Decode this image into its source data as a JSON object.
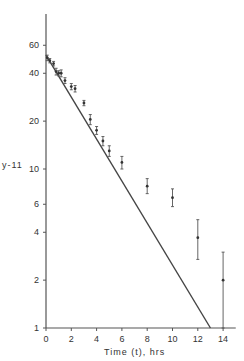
{
  "chart_data": {
    "type": "scatter",
    "title": "",
    "xlabel": "Time (t), hrs",
    "ylabel": "y-11",
    "yscale": "log",
    "xlim": [
      0,
      15
    ],
    "ylim": [
      1,
      90
    ],
    "grid": false,
    "x_ticks": [
      0,
      2,
      4,
      6,
      8,
      10,
      12,
      14
    ],
    "x_tick_labels": [
      "0",
      "2",
      "4",
      "6",
      "8",
      "10",
      "12",
      "14"
    ],
    "y_ticks": [
      1,
      2,
      4,
      6,
      10,
      20,
      40,
      60
    ],
    "y_tick_labels": [
      "1",
      "2",
      "4",
      "6",
      "10",
      "20",
      "40",
      "60"
    ],
    "series": [
      {
        "name": "observed",
        "style": "points with error bars",
        "points": [
          {
            "x": 0.1,
            "y": 50,
            "lo": 48,
            "hi": 52
          },
          {
            "x": 0.3,
            "y": 48,
            "lo": 46.5,
            "hi": 49.5
          },
          {
            "x": 0.6,
            "y": 46,
            "lo": 44.5,
            "hi": 47.5
          },
          {
            "x": 0.8,
            "y": 41,
            "lo": 39,
            "hi": 43
          },
          {
            "x": 1.0,
            "y": 40,
            "lo": 38.5,
            "hi": 41.5
          },
          {
            "x": 1.2,
            "y": 40,
            "lo": 38,
            "hi": 42
          },
          {
            "x": 1.5,
            "y": 36,
            "lo": 34.5,
            "hi": 37.5
          },
          {
            "x": 2.0,
            "y": 33,
            "lo": 31.5,
            "hi": 34.5
          },
          {
            "x": 2.3,
            "y": 32,
            "lo": 30.5,
            "hi": 33.5
          },
          {
            "x": 3.0,
            "y": 26,
            "lo": 25,
            "hi": 27
          },
          {
            "x": 3.5,
            "y": 20.5,
            "lo": 19,
            "hi": 22
          },
          {
            "x": 4.0,
            "y": 17.5,
            "lo": 16.5,
            "hi": 18.5
          },
          {
            "x": 4.5,
            "y": 15,
            "lo": 14,
            "hi": 16
          },
          {
            "x": 5.0,
            "y": 13,
            "lo": 12,
            "hi": 14
          },
          {
            "x": 6.0,
            "y": 11,
            "lo": 10,
            "hi": 12
          },
          {
            "x": 8.0,
            "y": 7.8,
            "lo": 7.0,
            "hi": 8.7
          },
          {
            "x": 10.0,
            "y": 6.6,
            "lo": 5.8,
            "hi": 7.5
          },
          {
            "x": 12.0,
            "y": 3.7,
            "lo": 2.7,
            "hi": 4.8
          },
          {
            "x": 14.0,
            "y": 2.0,
            "lo": 1.0,
            "hi": 3.0
          }
        ]
      },
      {
        "name": "fitted line",
        "style": "line",
        "x": [
          0,
          13
        ],
        "y": [
          52,
          1
        ]
      }
    ]
  }
}
